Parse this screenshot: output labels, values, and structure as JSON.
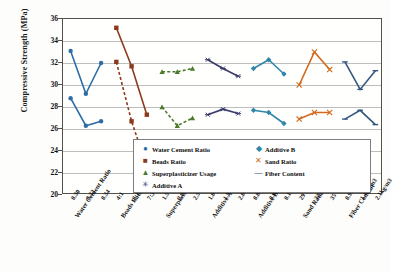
{
  "chart_data": {
    "type": "line",
    "title": "",
    "xlabel": "",
    "ylabel": "Compressive  Strength (MPa)",
    "ylim": [
      20,
      36
    ],
    "ytick_step": 2,
    "yticks": [
      "36",
      "34",
      "32",
      "30",
      "28",
      "26",
      "24",
      "22",
      "20"
    ],
    "grid": true,
    "legend_position": "inside-bottom-right",
    "groups": [
      {
        "name": "Water Cement Ratio",
        "ticks": [
          "0.30",
          "0.32",
          "0.34"
        ]
      },
      {
        "name": "Beads Ratio",
        "ticks": [
          "4:1",
          "3:1",
          "7:3"
        ]
      },
      {
        "name": "Superplasticizer Usage",
        "ticks": [
          "1.5%",
          "2.0%",
          "2.5%"
        ]
      },
      {
        "name": "Additive A",
        "ticks": [
          "1.0%",
          "1.5%",
          "2.0%"
        ]
      },
      {
        "name": "Additive B",
        "ticks": [
          "0.06%",
          "0.08%",
          "0.10%"
        ]
      },
      {
        "name": "Sand Ratio",
        "ticks": [
          "29%",
          "32%",
          "35%"
        ]
      },
      {
        "name": "Fiber Content",
        "ticks": [
          "0.9kg/m3",
          "1.4kg/m3",
          "2.1kg/m3"
        ]
      }
    ],
    "series": [
      {
        "name": "Water Cement Ratio",
        "color": "#2E6DA4",
        "marker": "circle",
        "line": "solid",
        "categories": [
          "0.30",
          "0.32",
          "0.34"
        ],
        "upper": [
          33.1,
          29.2,
          32.0
        ],
        "lower": [
          28.8,
          26.3,
          26.7
        ]
      },
      {
        "name": "Beads Ratio",
        "color": "#8B3A1E",
        "marker": "square",
        "line": "solid-and-dashed",
        "categories": [
          "4:1",
          "3:1",
          "7:3"
        ],
        "upper": [
          35.2,
          31.7,
          27.3
        ],
        "lower": [
          32.1,
          26.7,
          22.6
        ]
      },
      {
        "name": "Superplasticizer Usage",
        "color": "#4B7A2B",
        "marker": "triangle",
        "line": "dashed",
        "categories": [
          "1.5%",
          "2.0%",
          "2.5%"
        ],
        "upper": [
          31.2,
          31.2,
          31.5
        ],
        "lower": [
          28.0,
          26.3,
          27.0
        ]
      },
      {
        "name": "Additive A",
        "color": "#3B3B6D",
        "marker": "asterisk",
        "line": "solid",
        "categories": [
          "1.0%",
          "1.5%",
          "2.0%"
        ],
        "upper": [
          32.3,
          31.5,
          30.8
        ],
        "lower": [
          27.3,
          27.8,
          27.4
        ]
      },
      {
        "name": "Additive B",
        "color": "#2E86AB",
        "marker": "diamond",
        "line": "solid",
        "categories": [
          "0.06%",
          "0.08%",
          "0.10%"
        ],
        "upper": [
          31.5,
          32.3,
          31.0
        ],
        "lower": [
          27.7,
          27.5,
          26.5
        ]
      },
      {
        "name": "Sand Ratio",
        "color": "#D2691E",
        "marker": "cross",
        "line": "solid",
        "categories": [
          "29%",
          "32%",
          "35%"
        ],
        "upper": [
          30.0,
          33.0,
          31.4
        ],
        "lower": [
          26.9,
          27.5,
          27.5
        ]
      },
      {
        "name": "Fiber Content",
        "color": "#33577F",
        "marker": "dash",
        "line": "solid",
        "categories": [
          "0.9kg/m3",
          "1.4kg/m3",
          "2.1kg/m3"
        ],
        "upper": [
          32.1,
          29.6,
          31.3
        ],
        "lower": [
          26.9,
          27.7,
          26.4
        ]
      }
    ]
  },
  "legend": {
    "items": [
      {
        "label": "Water Cement Ratio",
        "marker": "circle-marker",
        "color": "#2E6DA4"
      },
      {
        "label": "Additive B",
        "marker": "diamond-marker",
        "color": "#2E86AB"
      },
      {
        "label": "Beads Ratio",
        "marker": "square-marker",
        "color": "#8B3A1E"
      },
      {
        "label": "Sand Ratio",
        "marker": "cross-marker",
        "color": "#D2691E"
      },
      {
        "label": "Superplasticizer Usage",
        "marker": "triangle-marker",
        "color": "#4B7A2B"
      },
      {
        "label": "Fiber Content",
        "marker": "dash-marker",
        "color": "#33577F"
      },
      {
        "label": "Additive A",
        "marker": "asterisk-marker",
        "color": "#3B3B6D"
      }
    ]
  }
}
